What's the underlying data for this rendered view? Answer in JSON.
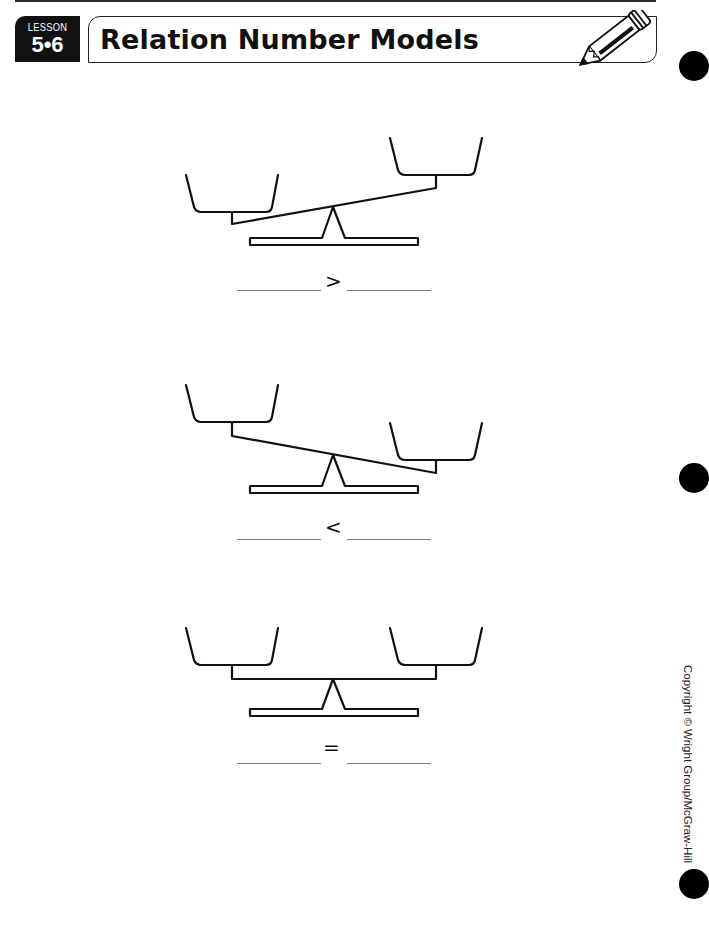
{
  "header": {
    "lesson_label": "LESSON",
    "lesson_number": "5•6",
    "title": "Relation Number Models",
    "icon": "pencil-icon"
  },
  "problems": [
    {
      "relation": "greater-than",
      "symbol": ">",
      "left_blank": "",
      "right_blank": "",
      "tilt": "left-pan-lower"
    },
    {
      "relation": "less-than",
      "symbol": "<",
      "left_blank": "",
      "right_blank": "",
      "tilt": "right-pan-lower"
    },
    {
      "relation": "equal",
      "symbol": "=",
      "left_blank": "",
      "right_blank": "",
      "tilt": "level"
    }
  ],
  "footer": {
    "copyright": "Copyright © Wright Group/McGraw-Hill"
  },
  "colors": {
    "ink": "#111111",
    "paper": "#ffffff"
  }
}
